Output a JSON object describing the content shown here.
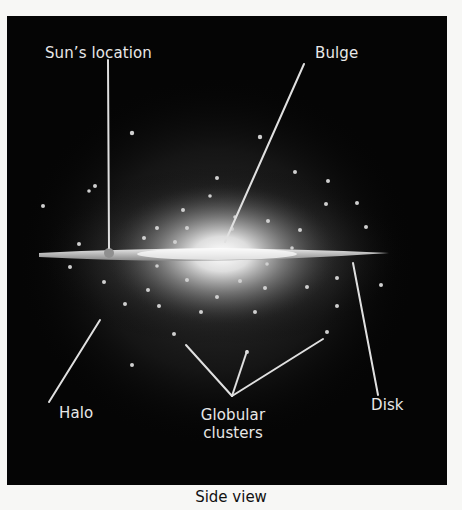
{
  "figure": {
    "caption": "Side view",
    "labels": {
      "sun": "Sun’s location",
      "bulge": "Bulge",
      "halo": "Halo",
      "globular_line1": "Globular",
      "globular_line2": "clusters",
      "disk": "Disk"
    },
    "colors": {
      "background": "#050505",
      "page": "#f7f7f5",
      "label_text": "#e8e8e8",
      "leader_line": "#e0e0e0",
      "disk": "#d8d8d8",
      "cluster_dot": "#cfcfcf"
    },
    "components": [
      "Sun’s location",
      "Bulge",
      "Halo",
      "Globular clusters",
      "Disk"
    ]
  }
}
